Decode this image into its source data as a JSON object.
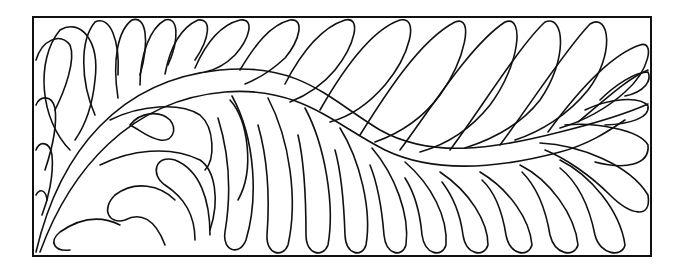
{
  "illustration": {
    "subject": "feather quilting motif in rectangular border",
    "colors": {
      "line": "#111111",
      "background": "#ffffff"
    },
    "frame": {
      "x": 33,
      "y": 17,
      "width": 618,
      "height": 239
    }
  }
}
